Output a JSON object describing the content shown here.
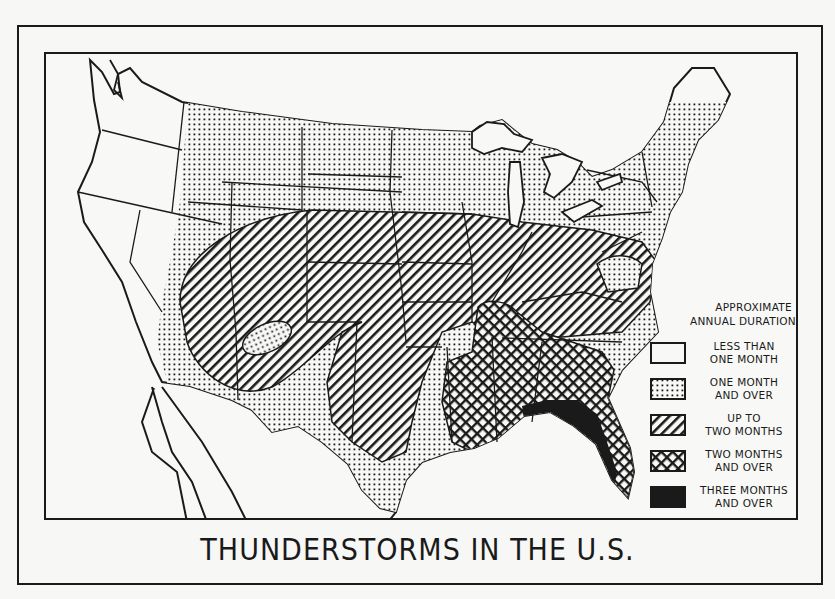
{
  "title": "THUNDERSTORMS IN THE U.S.",
  "legend": {
    "heading_line1": "APPROXIMATE",
    "heading_line2": "ANNUAL DURATION",
    "items": [
      {
        "line1": "LESS THAN",
        "line2": "ONE MONTH",
        "pattern": "blank"
      },
      {
        "line1": "ONE MONTH",
        "line2": "AND OVER",
        "pattern": "dots"
      },
      {
        "line1": "UP TO",
        "line2": "TWO MONTHS",
        "pattern": "diagonal-stripes"
      },
      {
        "line1": "TWO MONTHS",
        "line2": "AND OVER",
        "pattern": "crosshatch"
      },
      {
        "line1": "THREE MONTHS",
        "line2": "AND OVER",
        "pattern": "solid-black"
      }
    ]
  },
  "map": {
    "subject": "United States",
    "regions": [
      {
        "name": "Pacific coast states",
        "category": "LESS THAN ONE MONTH"
      },
      {
        "name": "Northern plains, Rockies, Great Lakes, Northeast",
        "category": "ONE MONTH AND OVER"
      },
      {
        "name": "Central Rockies, Great Plains, Midwest, mid-Atlantic band",
        "category": "UP TO TWO MONTHS"
      },
      {
        "name": "Gulf states and Southeast",
        "category": "TWO MONTHS AND OVER"
      },
      {
        "name": "Florida and Gulf coast",
        "category": "THREE MONTHS AND OVER"
      }
    ]
  },
  "colors": {
    "ink": "#1a1a1a",
    "paper": "#f8f8f6"
  }
}
